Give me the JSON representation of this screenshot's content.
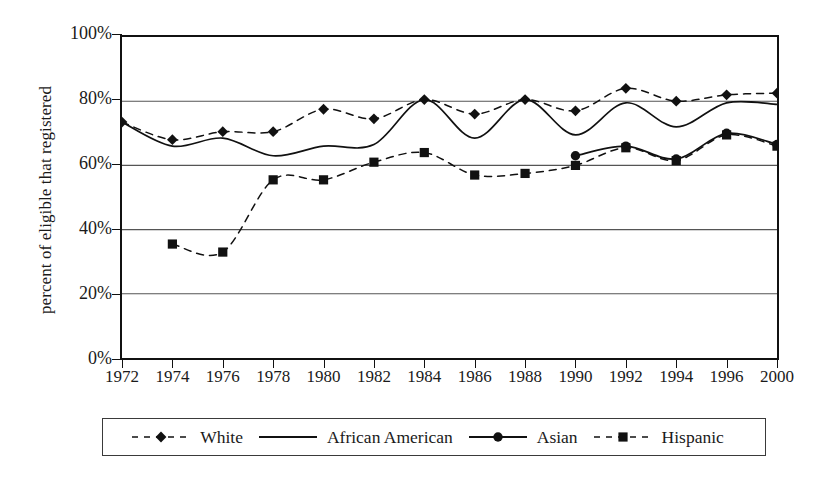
{
  "chart_data": {
    "type": "line",
    "title": "",
    "xlabel": "",
    "ylabel": "percent of eligible that registered",
    "grid": true,
    "legend_position": "bottom",
    "x": [
      1972,
      1974,
      1976,
      1978,
      1980,
      1982,
      1984,
      1986,
      1988,
      1990,
      1992,
      1994,
      1996,
      2000
    ],
    "categories": [
      "1972",
      "1974",
      "1976",
      "1978",
      "1980",
      "1982",
      "1984",
      "1986",
      "1988",
      "1990",
      "1992",
      "1994",
      "1996",
      "2000"
    ],
    "xtick_labels": [
      "1972",
      "1974",
      "1976",
      "1978",
      "1980",
      "1982",
      "1984",
      "1986",
      "1988",
      "1990",
      "1992",
      "1994",
      "1996",
      "2000"
    ],
    "ytick_labels": [
      "0%",
      "20%",
      "40%",
      "60%",
      "80%",
      "100%"
    ],
    "ytick_values": [
      0,
      20,
      40,
      60,
      80,
      100
    ],
    "ylim": [
      0,
      100
    ],
    "series": [
      {
        "name": "White",
        "marker": "diamond",
        "line": "dashed",
        "values": [
          73.5,
          68,
          70.5,
          70.5,
          77.5,
          74.5,
          80.5,
          76,
          80.5,
          77,
          84,
          80,
          82,
          82.5
        ]
      },
      {
        "name": "African American",
        "marker": "none",
        "line": "solid",
        "values": [
          73.5,
          66,
          68.5,
          63,
          66,
          66.5,
          80.5,
          68.5,
          80.5,
          69.5,
          79.5,
          72,
          79.5,
          79
        ]
      },
      {
        "name": "Asian",
        "marker": "circle",
        "line": "solid",
        "values": [
          null,
          null,
          null,
          null,
          null,
          null,
          null,
          null,
          null,
          63,
          66,
          62,
          70,
          66.5
        ]
      },
      {
        "name": "Hispanic",
        "marker": "square",
        "line": "dashed",
        "values": [
          null,
          35.5,
          33,
          55.5,
          55.5,
          61,
          64,
          57,
          57.5,
          60,
          65.5,
          61.5,
          69.5,
          66
        ]
      }
    ]
  },
  "legend": {
    "items": [
      {
        "label": "White",
        "marker": "diamond",
        "line": "dashed"
      },
      {
        "label": "African American",
        "marker": "none",
        "line": "solid"
      },
      {
        "label": "Asian",
        "marker": "circle",
        "line": "solid"
      },
      {
        "label": "Hispanic",
        "marker": "square",
        "line": "dashed"
      }
    ]
  },
  "colors": {
    "ink": "#111111",
    "grid": "#555555",
    "background": "#ffffff"
  }
}
